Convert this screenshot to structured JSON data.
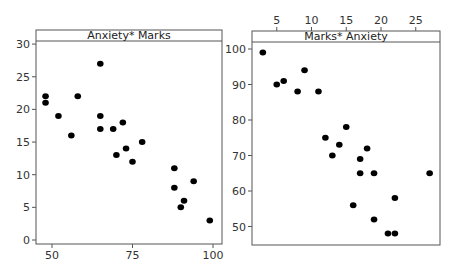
{
  "chart_data": [
    {
      "type": "scatter",
      "title": "Anxiety* Marks",
      "xlabel": "",
      "ylabel": "",
      "xlim": [
        45,
        102
      ],
      "ylim": [
        -0.5,
        30.5
      ],
      "xticks": [
        50,
        75,
        100
      ],
      "yticks": [
        0,
        5,
        10,
        15,
        20,
        25,
        30
      ],
      "x_axis_position": "bottom",
      "y_axis_position": "left",
      "grid": false,
      "marker_color": "#000000",
      "points": [
        {
          "x": 48,
          "y": 22
        },
        {
          "x": 48,
          "y": 21
        },
        {
          "x": 52,
          "y": 19
        },
        {
          "x": 58,
          "y": 22
        },
        {
          "x": 56,
          "y": 16
        },
        {
          "x": 65,
          "y": 27
        },
        {
          "x": 65,
          "y": 19
        },
        {
          "x": 65,
          "y": 17
        },
        {
          "x": 69,
          "y": 17
        },
        {
          "x": 72,
          "y": 18
        },
        {
          "x": 70,
          "y": 13
        },
        {
          "x": 73,
          "y": 14
        },
        {
          "x": 75,
          "y": 12
        },
        {
          "x": 78,
          "y": 15
        },
        {
          "x": 88,
          "y": 11
        },
        {
          "x": 88,
          "y": 8
        },
        {
          "x": 94,
          "y": 9
        },
        {
          "x": 91,
          "y": 6
        },
        {
          "x": 90,
          "y": 5
        },
        {
          "x": 99,
          "y": 3
        }
      ]
    },
    {
      "type": "scatter",
      "title": "Marks* Anxiety",
      "xlabel": "",
      "ylabel": "",
      "xlim": [
        1.5,
        28.5
      ],
      "ylim": [
        44,
        102
      ],
      "xticks": [
        5,
        10,
        15,
        20,
        25
      ],
      "yticks": [
        50,
        60,
        70,
        80,
        90,
        100
      ],
      "x_axis_position": "top",
      "y_axis_position": "left",
      "grid": false,
      "marker_color": "#000000",
      "points": [
        {
          "x": 3,
          "y": 99
        },
        {
          "x": 5,
          "y": 90
        },
        {
          "x": 6,
          "y": 91
        },
        {
          "x": 8,
          "y": 88
        },
        {
          "x": 9,
          "y": 94
        },
        {
          "x": 11,
          "y": 88
        },
        {
          "x": 15,
          "y": 78
        },
        {
          "x": 12,
          "y": 75
        },
        {
          "x": 14,
          "y": 73
        },
        {
          "x": 13,
          "y": 70
        },
        {
          "x": 18,
          "y": 72
        },
        {
          "x": 17,
          "y": 69
        },
        {
          "x": 17,
          "y": 65
        },
        {
          "x": 19,
          "y": 65
        },
        {
          "x": 27,
          "y": 65
        },
        {
          "x": 16,
          "y": 56
        },
        {
          "x": 22,
          "y": 58
        },
        {
          "x": 19,
          "y": 52
        },
        {
          "x": 21,
          "y": 48
        },
        {
          "x": 22,
          "y": 48
        }
      ]
    }
  ],
  "panels": {
    "left": {
      "title": "Anxiety* Marks"
    },
    "right": {
      "title": "Marks* Anxiety"
    }
  }
}
